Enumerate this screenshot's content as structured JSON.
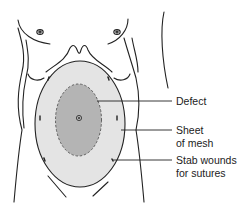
{
  "diagram": {
    "labels": {
      "defect": "Defect",
      "mesh_line1": "Sheet",
      "mesh_line2": "of mesh",
      "stab_line1": "Stab wounds",
      "stab_line2": "for sutures"
    },
    "colors": {
      "outline": "#222222",
      "mesh_fill": "#e4e4e4",
      "defect_fill": "#b4b4b4",
      "background": "#ffffff"
    }
  }
}
